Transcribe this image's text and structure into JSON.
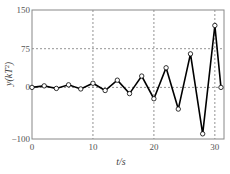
{
  "chart_data": {
    "type": "line",
    "title": "",
    "xlabel": "t/s",
    "ylabel": "y(kT²)",
    "xlim": [
      0,
      31.5
    ],
    "ylim": [
      -100,
      150
    ],
    "xticks": [
      0,
      10,
      20,
      30
    ],
    "yticks": [
      -100,
      0,
      75,
      150
    ],
    "xtick_labels": [
      "0",
      "10",
      "20",
      "30"
    ],
    "ytick_labels": [
      "−100",
      "0",
      "75",
      "150"
    ],
    "grid": {
      "x": [
        10,
        20,
        30
      ],
      "y": [
        0,
        75
      ],
      "style": "dashed"
    },
    "legend": null,
    "series": [
      {
        "name": "y",
        "marker": "open-circle",
        "color": "#000000",
        "x": [
          0,
          2,
          4,
          6,
          8,
          10,
          12,
          14,
          16,
          18,
          20,
          22,
          24,
          26,
          28,
          30,
          31
        ],
        "values": [
          0,
          3,
          -2,
          5,
          -3,
          8,
          -6,
          14,
          -12,
          22,
          -22,
          38,
          -42,
          65,
          -90,
          120,
          0
        ]
      }
    ]
  },
  "colors": {
    "line": "#000000",
    "frame": "#888888",
    "grid": "#777777",
    "marker_fill": "#ffffff"
  }
}
